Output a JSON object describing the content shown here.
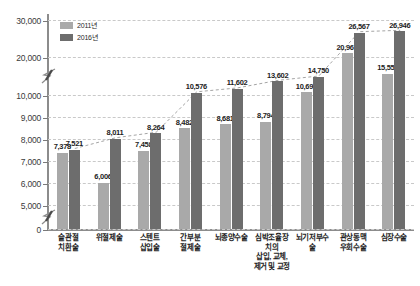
{
  "chart_data": {
    "type": "bar",
    "title": "",
    "xlabel": "",
    "ylabel": "",
    "grid": true,
    "legend_position": "top-left",
    "categories": [
      "슬관절\n치환술",
      "위절제술",
      "스텐트\n삽입술",
      "간부분\n절제술",
      "뇌종양수술",
      "심박조율장치의\n삽입, 교체,\n제거 및 교정",
      "뇌기저부수술",
      "관상동맥\n우회수술",
      "심장수술"
    ],
    "series": [
      {
        "name": "2011년",
        "color": "#a9a9a9",
        "values": [
          7378,
          6006,
          7458,
          8482,
          8681,
          8794,
          10693,
          20963,
          15557
        ]
      },
      {
        "name": "2016년",
        "color": "#6d6d6d",
        "values": [
          7521,
          8011,
          8264,
          10576,
          11602,
          13602,
          14750,
          26567,
          26946
        ]
      }
    ],
    "yticks": [
      "0",
      "5,000",
      "6,000",
      "7,000",
      "8,000",
      "9,000",
      "10,000",
      "20,000",
      "30,000"
    ],
    "ylim": [
      0,
      30000
    ],
    "axis_breaks": [
      "between 0 and 5,000",
      "between 10,000 and 20,000"
    ]
  },
  "legend": {
    "items": [
      {
        "label": "2011년",
        "color": "#a9a9a9"
      },
      {
        "label": "2016년",
        "color": "#6d6d6d"
      }
    ]
  },
  "colors": {
    "series_2011": "#a9a9a9",
    "series_2016": "#6d6d6d",
    "axis": "#8c8c8c",
    "grid": "#c9c9c9",
    "text": "#1d1d1d",
    "background": "#ffffff"
  }
}
